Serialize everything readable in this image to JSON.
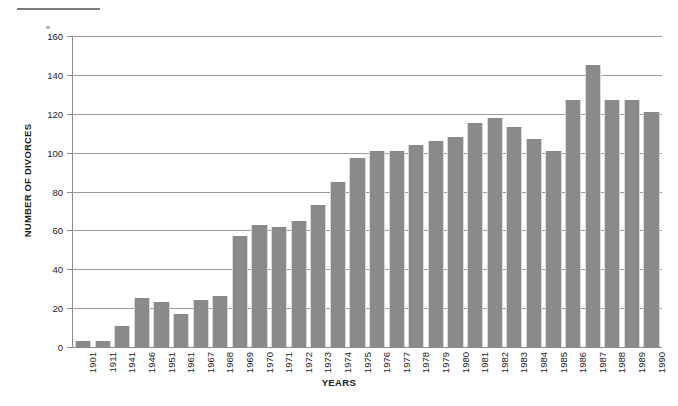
{
  "chart_data": {
    "type": "bar",
    "title": "",
    "xlabel": "YEARS",
    "ylabel": "NUMBER OF DIVORCES",
    "ylim": [
      0,
      160
    ],
    "ytick_step": 20,
    "yticks": [
      0,
      20,
      40,
      60,
      80,
      100,
      120,
      140,
      160
    ],
    "grid": "horizontal",
    "legend": "none",
    "bar_color": "#8a8a8a",
    "categories": [
      "1901",
      "1911",
      "1941",
      "1946",
      "1951",
      "1961",
      "1967",
      "1968",
      "1969",
      "1970",
      "1971",
      "1972",
      "1973",
      "1974",
      "1975",
      "1976",
      "1977",
      "1978",
      "1979",
      "1980",
      "1981",
      "1982",
      "1983",
      "1984",
      "1985",
      "1986",
      "1987",
      "1988",
      "1989",
      "1990"
    ],
    "values": [
      3,
      3,
      11,
      25,
      23,
      17,
      24,
      26,
      57,
      63,
      62,
      65,
      73,
      85,
      97,
      101,
      101,
      104,
      106,
      108,
      115,
      118,
      113,
      107,
      101,
      127,
      145,
      127,
      127,
      121
    ]
  }
}
